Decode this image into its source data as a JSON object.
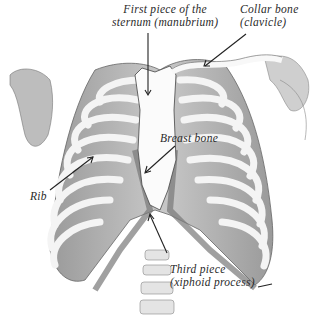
{
  "diagram": {
    "labels": [
      {
        "id": "manubrium",
        "line1": "First piece of the",
        "line2": "sternum (manubrium)"
      },
      {
        "id": "clavicle",
        "line1": "Collar bone",
        "line2": "(clavicle)"
      },
      {
        "id": "breast-bone",
        "line1": "Breast bone"
      },
      {
        "id": "rib",
        "line1": "Rib"
      },
      {
        "id": "xiphoid",
        "line1": "Third piece",
        "line2": "(xiphoid process)"
      }
    ],
    "colors": {
      "background": "#ffffff",
      "bone": "#f4f4f4",
      "shade": "#8a8a8a",
      "ink": "#2a2a2a"
    }
  }
}
